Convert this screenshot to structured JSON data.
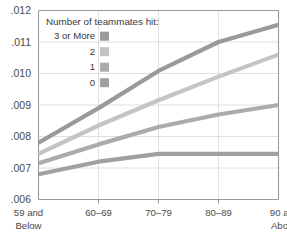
{
  "chart_data": {
    "type": "line",
    "title": "",
    "xlabel": "",
    "ylabel": "",
    "legend_title": "Number of teammates hit:",
    "legend_position": "inside-top-left",
    "grid": true,
    "categories": [
      "59 and Below",
      "60–69",
      "70–79",
      "80–89",
      "90 and Above"
    ],
    "category_lines": [
      [
        "59 and",
        "Below"
      ],
      [
        "60–69",
        ""
      ],
      [
        "70–79",
        ""
      ],
      [
        "80–89",
        ""
      ],
      [
        "90 and",
        "Above"
      ]
    ],
    "ylim": [
      0.006,
      0.012
    ],
    "ytick_values": [
      0.006,
      0.007,
      0.008,
      0.009,
      0.01,
      0.011,
      0.012
    ],
    "ytick_labels": [
      ".006",
      ".007",
      ".008",
      ".009",
      ".010",
      ".011",
      ".012"
    ],
    "series": [
      {
        "name": "3 or More",
        "color": "#9a9a9a",
        "values": [
          0.0078,
          0.0089,
          0.01008,
          0.011,
          0.01155
        ]
      },
      {
        "name": "2",
        "color": "#c4c4c4",
        "values": [
          0.00745,
          0.00835,
          0.00915,
          0.0099,
          0.0106
        ]
      },
      {
        "name": "1",
        "color": "#ababab",
        "values": [
          0.00715,
          0.00775,
          0.0083,
          0.0087,
          0.009
        ]
      },
      {
        "name": "0",
        "color": "#a0a0a0",
        "values": [
          0.0068,
          0.0072,
          0.00745,
          0.00745,
          0.00745
        ]
      }
    ]
  },
  "legend": {
    "title": "Number of teammates hit:",
    "items": [
      {
        "label": "3 or More",
        "color": "#9a9a9a"
      },
      {
        "label": "2",
        "color": "#c4c4c4"
      },
      {
        "label": "1",
        "color": "#ababab"
      },
      {
        "label": "0",
        "color": "#a0a0a0"
      }
    ]
  }
}
